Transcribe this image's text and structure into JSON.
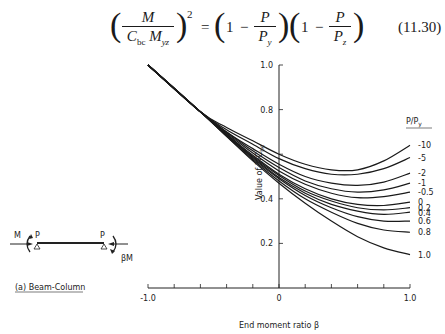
{
  "equation": {
    "lhs_num": "M",
    "lhs_den_main": "C",
    "lhs_den_sub": "bc",
    "lhs_den_m": "M",
    "lhs_den_m_sub": "yz",
    "exponent": "2",
    "equals": "=",
    "one": "1",
    "minus": "−",
    "p": "P",
    "py_main": "P",
    "py_sub": "y",
    "pz_main": "P",
    "pz_sub": "z",
    "number": "(11.30)"
  },
  "diagram": {
    "moment_left": "M",
    "load_left": "P",
    "load_right": "P",
    "moment_right": "βM",
    "caption": "(a) Beam-Column"
  },
  "chart_data": {
    "type": "line",
    "title": "",
    "xlabel": "End moment ratio β",
    "ylabel": "Value of 1/C_bc",
    "ylabel_main": "Value of 1/C",
    "ylabel_sub": "bc",
    "xlim": [
      -1.0,
      1.0
    ],
    "ylim": [
      0,
      1.0
    ],
    "x_tick_step": 0.2,
    "x_tick_labels": [
      {
        "value": -1.0,
        "label": "-1.0"
      },
      {
        "value": 0,
        "label": "0"
      },
      {
        "value": 1.0,
        "label": "1.0"
      }
    ],
    "y_ticks": [
      {
        "value": 0.2,
        "label": "0.2"
      },
      {
        "value": 0.4,
        "label": "0.4"
      },
      {
        "value": 0.6,
        "label": ""
      },
      {
        "value": 0.8,
        "label": "0.8"
      },
      {
        "value": 1.0,
        "label": "1.0"
      }
    ],
    "grid": false,
    "legend_title": "P/P_y",
    "legend_title_main": "P/P",
    "legend_title_sub": "y",
    "legend_position": "right",
    "x": [
      -1.0,
      -0.6,
      -0.4,
      -0.2,
      0.0,
      0.2,
      0.4,
      0.6,
      0.8,
      1.0
    ],
    "series": [
      {
        "name": "-10",
        "values": [
          1.0,
          0.79,
          0.72,
          0.66,
          0.6,
          0.555,
          0.53,
          0.53,
          0.57,
          0.64
        ]
      },
      {
        "name": "-5",
        "values": [
          1.0,
          0.79,
          0.71,
          0.645,
          0.58,
          0.535,
          0.51,
          0.51,
          0.535,
          0.585
        ]
      },
      {
        "name": "-2",
        "values": [
          1.0,
          0.79,
          0.7,
          0.625,
          0.555,
          0.5,
          0.47,
          0.46,
          0.475,
          0.515
        ]
      },
      {
        "name": "-1",
        "values": [
          1.0,
          0.79,
          0.7,
          0.615,
          0.54,
          0.48,
          0.445,
          0.43,
          0.44,
          0.47
        ]
      },
      {
        "name": "-0.5",
        "values": [
          1.0,
          0.79,
          0.695,
          0.605,
          0.525,
          0.465,
          0.425,
          0.405,
          0.41,
          0.43
        ]
      },
      {
        "name": "0",
        "values": [
          1.0,
          0.79,
          0.69,
          0.595,
          0.51,
          0.445,
          0.4,
          0.375,
          0.37,
          0.385
        ]
      },
      {
        "name": "0.2",
        "values": [
          1.0,
          0.79,
          0.69,
          0.59,
          0.505,
          0.435,
          0.39,
          0.36,
          0.35,
          0.36
        ]
      },
      {
        "name": "0.4",
        "values": [
          1.0,
          0.79,
          0.685,
          0.585,
          0.495,
          0.425,
          0.375,
          0.345,
          0.33,
          0.34
        ]
      },
      {
        "name": "0.6",
        "values": [
          1.0,
          0.79,
          0.685,
          0.58,
          0.49,
          0.415,
          0.36,
          0.32,
          0.3,
          0.3
        ]
      },
      {
        "name": "0.8",
        "values": [
          1.0,
          0.79,
          0.68,
          0.575,
          0.48,
          0.4,
          0.34,
          0.29,
          0.26,
          0.25
        ]
      },
      {
        "name": "1.0",
        "values": [
          1.0,
          0.79,
          0.68,
          0.57,
          0.47,
          0.38,
          0.3,
          0.23,
          0.18,
          0.15
        ]
      }
    ]
  }
}
